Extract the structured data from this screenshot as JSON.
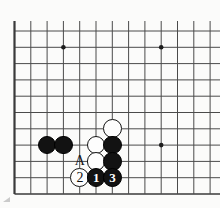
{
  "diagram": {
    "kind": "go-board-diagram",
    "board": {
      "background_color": "#fbfbfa",
      "line_color": "#4a4a4a",
      "edge_line_color": "#3a3a3a",
      "cell_size": 16.3,
      "origin_x": 14.5,
      "origin_y": 31,
      "columns": 12,
      "rows": 10,
      "left_edge_thick": true,
      "bottom_edge_thick": true,
      "top_edge_thick": false,
      "right_edge_cropped": true
    },
    "star_points": [
      {
        "name": "star-point-upper-left",
        "col": 3,
        "row": 1
      },
      {
        "name": "star-point-upper-right",
        "col": 9,
        "row": 1
      },
      {
        "name": "star-point-lower-right",
        "col": 9,
        "row": 7
      }
    ],
    "stones": [
      {
        "id": "black-stone-left-outer",
        "color": "black",
        "col": 2,
        "row": 7,
        "label": ""
      },
      {
        "id": "black-stone-left-inner",
        "color": "black",
        "col": 3,
        "row": 7,
        "label": ""
      },
      {
        "id": "white-stone-top",
        "color": "white",
        "col": 6,
        "row": 6,
        "label": ""
      },
      {
        "id": "white-stone-middle",
        "color": "white",
        "col": 5,
        "row": 7,
        "label": ""
      },
      {
        "id": "black-stone-right-upper",
        "color": "black",
        "col": 6,
        "row": 7,
        "label": ""
      },
      {
        "id": "white-stone-lower",
        "color": "white",
        "col": 5,
        "row": 8,
        "label": ""
      },
      {
        "id": "black-stone-right-lower",
        "color": "black",
        "col": 6,
        "row": 8,
        "label": ""
      },
      {
        "id": "white-move-2",
        "color": "white",
        "col": 4,
        "row": 9,
        "label": "2"
      },
      {
        "id": "black-move-1",
        "color": "black",
        "col": 5,
        "row": 9,
        "label": "1"
      },
      {
        "id": "black-move-3",
        "color": "black",
        "col": 6,
        "row": 9,
        "label": "3"
      }
    ],
    "markers": [
      {
        "id": "point-marker-A",
        "text": "A",
        "col": 4,
        "row": 8
      }
    ],
    "artifact": {
      "name": "page-edge-artifact",
      "color": "#b9b9b9"
    }
  }
}
